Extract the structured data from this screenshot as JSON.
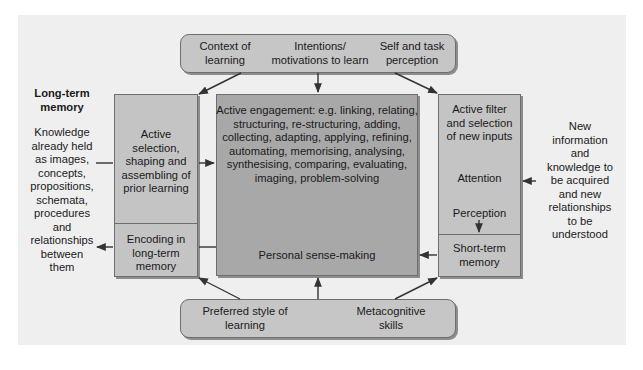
{
  "diagram": {
    "top_box": {
      "items": [
        {
          "label": "Context of\nlearning"
        },
        {
          "label": "Intentions/\nmotivations to learn"
        },
        {
          "label": "Self and task\nperception"
        }
      ]
    },
    "long_term_memory": {
      "heading": "Long-term\nmemory",
      "description": "Knowledge\nalready held\nas images,\nconcepts,\npropositions,\nschemata,\nprocedures\nand\nrelationships\nbetween\nthem"
    },
    "left_box": {
      "upper": "Active\nselection,\nshaping and\nassembling of\nprior learning",
      "lower": "Encoding in\nlong-term\nmemory"
    },
    "center_box": {
      "upper": "Active engagement: e.g. linking, relating,\nstructuring, re-structuring, adding,\ncollecting, adapting, applying, refining,\nautomating, memorising, analysing,\nsynthesising, comparing, evaluating,\nimaging, problem-solving",
      "lower": "Personal sense-making"
    },
    "right_box": {
      "header": "Active filter\nand selection\nof new inputs",
      "attention": "Attention",
      "perception": "Perception",
      "lower": "Short-term\nmemory"
    },
    "new_information": "New\ninformation\nand\nknowledge to\nbe acquired\nand new\nrelationships\nto be\nunderstood",
    "bottom_box": {
      "items": [
        {
          "label": "Preferred style of\nlearning"
        },
        {
          "label": "Metacognitive\nskills"
        }
      ]
    },
    "colors": {
      "background": "#efefef",
      "light_box": "#c4c4c4",
      "dark_box": "#a8a8a8",
      "border": "#6e6e6e",
      "arrow": "#333333"
    }
  }
}
